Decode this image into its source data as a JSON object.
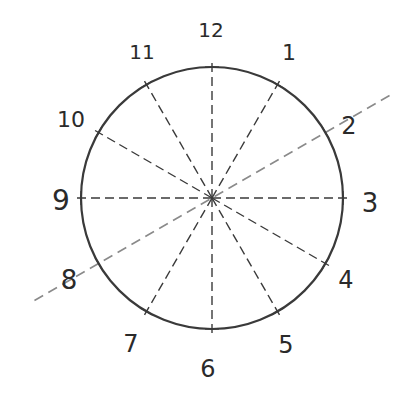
{
  "diagram": {
    "type": "clock-face-spokes",
    "center": {
      "x": 212,
      "y": 198
    },
    "radius": 131,
    "colors": {
      "circle": "#3a3a3a",
      "spoke": "#3a3a3a",
      "highlight_line": "#8a8a8a",
      "text": "#2a2a2a"
    },
    "highlight_line": {
      "from_label": "8",
      "to_label": "2",
      "description": "light gray dashed line through center extending past circle, passing 2 and 8"
    },
    "labels": [
      {
        "text": "12",
        "x": 211,
        "y": 30,
        "size": 20
      },
      {
        "text": "1",
        "x": 289,
        "y": 52,
        "size": 22
      },
      {
        "text": "2",
        "x": 349,
        "y": 126,
        "size": 24
      },
      {
        "text": "3",
        "x": 370,
        "y": 203,
        "size": 26
      },
      {
        "text": "4",
        "x": 346,
        "y": 280,
        "size": 24
      },
      {
        "text": "5",
        "x": 286,
        "y": 345,
        "size": 24
      },
      {
        "text": "6",
        "x": 208,
        "y": 369,
        "size": 24
      },
      {
        "text": "7",
        "x": 131,
        "y": 344,
        "size": 24
      },
      {
        "text": "8",
        "x": 69,
        "y": 280,
        "size": 26
      },
      {
        "text": "9",
        "x": 61,
        "y": 200,
        "size": 28
      },
      {
        "text": "10",
        "x": 71,
        "y": 119,
        "size": 22
      },
      {
        "text": "11",
        "x": 142,
        "y": 52,
        "size": 20
      }
    ]
  }
}
